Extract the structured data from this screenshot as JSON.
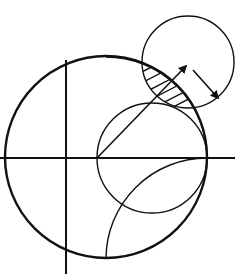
{
  "title": "Smith chart with stability circle and unstable region",
  "colors": {
    "ink": "#111111",
    "background": "#ffffff"
  },
  "smith_chart": {
    "outer_circle": {
      "cx": 106,
      "cy": 157,
      "r": 101,
      "label": "|Γ| = 1 boundary"
    },
    "real_axis": {
      "x1": 0,
      "x2": 235,
      "y": 158
    },
    "vertical_axis": {
      "x": 66,
      "y1": 60,
      "y2": 274
    },
    "unit_resistance_circle": {
      "cx": 152,
      "cy": 158,
      "r": 55
    },
    "reactance_arcs": [
      {
        "name": "upper",
        "from": [
          96,
          62
        ],
        "to": [
          207,
          158
        ],
        "r": 101,
        "sweep": 1
      },
      {
        "name": "lower",
        "from": [
          207,
          158
        ],
        "to": [
          107,
          257
        ],
        "r": 101,
        "sweep": 0
      }
    ]
  },
  "stability_circle": {
    "cx": 188,
    "cy": 62,
    "r": 46,
    "label": "stability circle"
  },
  "unstable_region": {
    "label": "hatched overlap region",
    "hatch_lines": 6
  },
  "arrows": [
    {
      "name": "radial-arrow",
      "from": [
        97,
        158
      ],
      "to": [
        186,
        66
      ]
    },
    {
      "name": "radius-arrow",
      "from": [
        193,
        70
      ],
      "to": [
        218,
        98
      ]
    }
  ]
}
